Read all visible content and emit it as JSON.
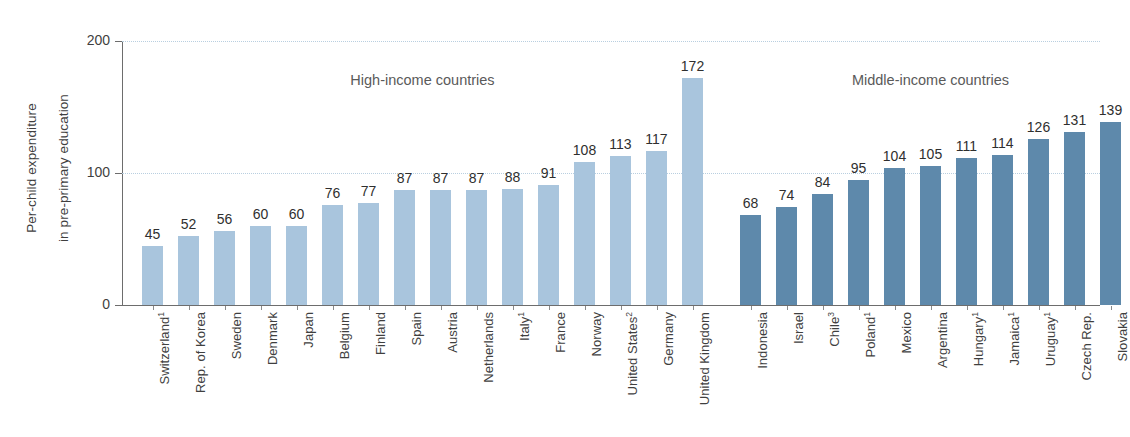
{
  "chart_data": {
    "type": "bar",
    "title": "",
    "xlabel": "",
    "ylabel": "Per-child expenditure in pre-primary education",
    "ylabel_line1": "Per-child expenditure",
    "ylabel_line2": "in pre-primary education",
    "ylim": [
      0,
      200
    ],
    "yticks": [
      0,
      100,
      200
    ],
    "ytick_labels": [
      "0",
      "100",
      "200"
    ],
    "grid": "horizontal-dotted",
    "legend": "none",
    "group_labels": [
      "High-income countries",
      "Middle-income countries"
    ],
    "colors": {
      "high_income": "#a9c5dd",
      "middle_income": "#5e89ab",
      "axis": "#6d6d6d",
      "gridline": "#b9cfe0",
      "text": "#3f3f3f"
    },
    "groups": [
      {
        "name": "High-income countries",
        "color": "#a9c5dd",
        "categories": [
          "Switzerland1",
          "Rep. of Korea",
          "Sweden",
          "Denmark",
          "Japan",
          "Belgium",
          "Finland",
          "Spain",
          "Austria",
          "Netherlands",
          "Italy1",
          "France",
          "Norway",
          "United States2",
          "Germany",
          "United Kingdom"
        ],
        "category_labels": [
          {
            "name": "Switzerland",
            "note": "1"
          },
          {
            "name": "Rep. of Korea",
            "note": ""
          },
          {
            "name": "Sweden",
            "note": ""
          },
          {
            "name": "Denmark",
            "note": ""
          },
          {
            "name": "Japan",
            "note": ""
          },
          {
            "name": "Belgium",
            "note": ""
          },
          {
            "name": "Finland",
            "note": ""
          },
          {
            "name": "Spain",
            "note": ""
          },
          {
            "name": "Austria",
            "note": ""
          },
          {
            "name": "Netherlands",
            "note": ""
          },
          {
            "name": "Italy",
            "note": "1"
          },
          {
            "name": "France",
            "note": ""
          },
          {
            "name": "Norway",
            "note": ""
          },
          {
            "name": "United States",
            "note": "2"
          },
          {
            "name": "Germany",
            "note": ""
          },
          {
            "name": "United Kingdom",
            "note": ""
          }
        ],
        "values": [
          45,
          52,
          56,
          60,
          60,
          76,
          77,
          87,
          87,
          87,
          88,
          91,
          108,
          113,
          117,
          172
        ]
      },
      {
        "name": "Middle-income countries",
        "color": "#5e89ab",
        "categories": [
          "Indonesia",
          "Israel",
          "Chile3",
          "Poland1",
          "Mexico",
          "Argentina",
          "Hungary1",
          "Jamaica1",
          "Uruguay1",
          "Czech Rep.",
          "Slovakia"
        ],
        "category_labels": [
          {
            "name": "Indonesia",
            "note": ""
          },
          {
            "name": "Israel",
            "note": ""
          },
          {
            "name": "Chile",
            "note": "3"
          },
          {
            "name": "Poland",
            "note": "1"
          },
          {
            "name": "Mexico",
            "note": ""
          },
          {
            "name": "Argentina",
            "note": ""
          },
          {
            "name": "Hungary",
            "note": "1"
          },
          {
            "name": "Jamaica",
            "note": "1"
          },
          {
            "name": "Uruguay",
            "note": "1"
          },
          {
            "name": "Czech Rep.",
            "note": ""
          },
          {
            "name": "Slovakia",
            "note": ""
          }
        ],
        "values": [
          68,
          74,
          84,
          95,
          104,
          105,
          111,
          114,
          126,
          131,
          139
        ]
      }
    ]
  }
}
